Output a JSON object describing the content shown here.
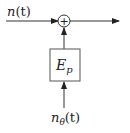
{
  "diagram": {
    "input_label": "n(t)",
    "input_label_main": "n",
    "input_label_arg": "(t)",
    "summer_symbol": "+",
    "block_label_main": "E",
    "block_label_sub": "p",
    "noise_label_main": "n",
    "noise_label_sub": "θ",
    "noise_label_arg": "(t)",
    "colors": {
      "line": "#333333",
      "background": "#ffffff"
    }
  }
}
